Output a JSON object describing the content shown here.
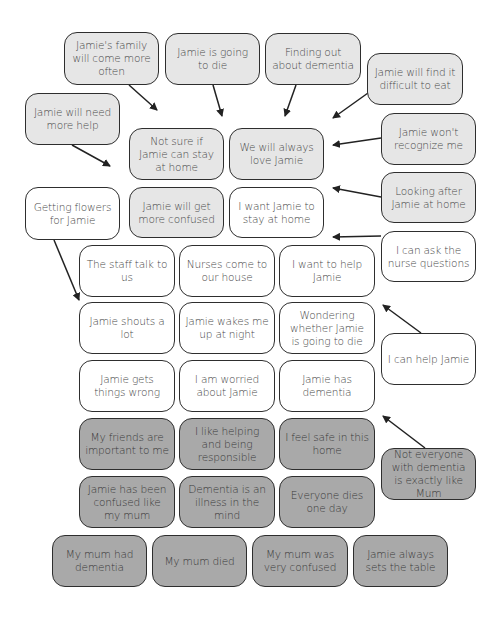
{
  "diagram": {
    "legend_colors": {
      "white": "#ffffff",
      "light": "#e6e6e6",
      "dark": "#a9a9a9",
      "border": "#2e2e2e",
      "text": "#4a4a4a"
    },
    "nodes": [
      {
        "id": "family-more-often",
        "label": "Jamie's family will come more often",
        "shade": "light"
      },
      {
        "id": "going-to-die",
        "label": "Jamie is going to die",
        "shade": "light"
      },
      {
        "id": "finding-out",
        "label": "Finding out about dementia",
        "shade": "light"
      },
      {
        "id": "difficult-to-eat",
        "label": "Jamie will find it difficult to eat",
        "shade": "light"
      },
      {
        "id": "need-more-help",
        "label": "Jamie will need more help",
        "shade": "light"
      },
      {
        "id": "not-sure-stay",
        "label": "Not sure if Jamie can stay at home",
        "shade": "light"
      },
      {
        "id": "always-love",
        "label": "We will always love Jamie",
        "shade": "light"
      },
      {
        "id": "wont-recognize",
        "label": "Jamie won't recognize me",
        "shade": "light"
      },
      {
        "id": "getting-flowers",
        "label": "Getting flowers for Jamie",
        "shade": "white"
      },
      {
        "id": "more-confused",
        "label": "Jamie will get more confused",
        "shade": "light"
      },
      {
        "id": "want-stay-home",
        "label": "I want Jamie to stay at home",
        "shade": "white"
      },
      {
        "id": "looking-after",
        "label": "Looking after Jamie at home",
        "shade": "light"
      },
      {
        "id": "ask-nurse",
        "label": "I can ask the nurse questions",
        "shade": "white"
      },
      {
        "id": "staff-talk",
        "label": "The staff talk to us",
        "shade": "white"
      },
      {
        "id": "nurses-come",
        "label": "Nurses come to our house",
        "shade": "white"
      },
      {
        "id": "want-to-help",
        "label": "I want to help Jamie",
        "shade": "white"
      },
      {
        "id": "shouts",
        "label": "Jamie shouts a lot",
        "shade": "white"
      },
      {
        "id": "wakes-me",
        "label": "Jamie wakes me up at night",
        "shade": "white"
      },
      {
        "id": "wondering-die",
        "label": "Wondering whether Jamie is going to die",
        "shade": "white"
      },
      {
        "id": "can-help",
        "label": "I can help Jamie",
        "shade": "white"
      },
      {
        "id": "things-wrong",
        "label": "Jamie gets things wrong",
        "shade": "white"
      },
      {
        "id": "worried",
        "label": "I am worried about Jamie",
        "shade": "white"
      },
      {
        "id": "has-dementia",
        "label": "Jamie has dementia",
        "shade": "white"
      },
      {
        "id": "friends-important",
        "label": "My friends are important to me",
        "shade": "dark"
      },
      {
        "id": "like-helping",
        "label": "I like helping and being responsible",
        "shade": "dark"
      },
      {
        "id": "feel-safe",
        "label": "I feel safe in this home",
        "shade": "dark"
      },
      {
        "id": "not-everyone",
        "label": "Not everyone with dementia is exactly like Mum",
        "shade": "dark"
      },
      {
        "id": "confused-like-mum",
        "label": "Jamie has been confused like my mum",
        "shade": "dark"
      },
      {
        "id": "illness-mind",
        "label": "Dementia is an illness in the mind",
        "shade": "dark"
      },
      {
        "id": "everyone-dies",
        "label": "Everyone dies one day",
        "shade": "dark"
      },
      {
        "id": "mum-had-dementia",
        "label": "My mum had dementia",
        "shade": "dark"
      },
      {
        "id": "mum-died",
        "label": "My mum died",
        "shade": "dark"
      },
      {
        "id": "mum-confused",
        "label": "My mum was very confused",
        "shade": "dark"
      },
      {
        "id": "sets-table",
        "label": "Jamie always sets the table",
        "shade": "dark"
      }
    ],
    "edges": [
      {
        "from": "family-more-often",
        "to": "not-sure-stay"
      },
      {
        "from": "going-to-die",
        "to": "not-sure-stay"
      },
      {
        "from": "finding-out",
        "to": "always-love"
      },
      {
        "from": "difficult-to-eat",
        "to": "always-love"
      },
      {
        "from": "need-more-help",
        "to": "not-sure-stay"
      },
      {
        "from": "wont-recognize",
        "to": "always-love"
      },
      {
        "from": "looking-after",
        "to": "always-love"
      },
      {
        "from": "ask-nurse",
        "to": "want-stay-home"
      },
      {
        "from": "getting-flowers",
        "to": "shouts"
      },
      {
        "from": "can-help",
        "to": "wondering-die"
      },
      {
        "from": "not-everyone",
        "to": "has-dementia"
      }
    ]
  }
}
